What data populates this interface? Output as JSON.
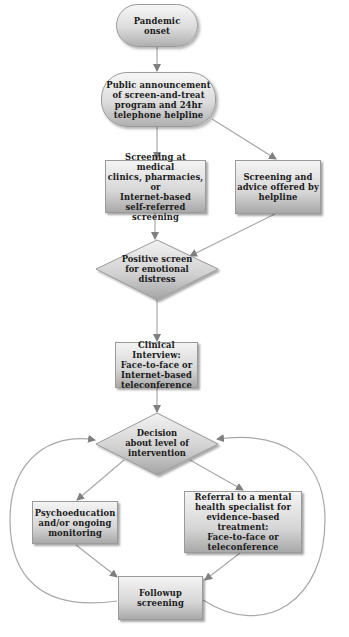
{
  "diagram": {
    "type": "flowchart",
    "colors": {
      "node_fill_top": "#f4f4f4",
      "node_fill_bottom": "#a9a9a9",
      "edge": "#9a9a9a",
      "arrowhead": "#7f7f7f",
      "text": "#1a1a1a"
    },
    "nodes": {
      "pandemic_onset": {
        "shape": "pill",
        "label": "Pandemic\nonset"
      },
      "public_announcement": {
        "shape": "pill",
        "label": "Public announcement\nof screen-and-treat\nprogram and 24hr\ntelephone helpline"
      },
      "screening_medical": {
        "shape": "rect",
        "label": "Screening at medical\nclinics, pharmacies, or\nInternet-based\nself-referred\nscreening"
      },
      "screening_helpline": {
        "shape": "rect",
        "label": "Screening and\nadvice offered by\nhelpline"
      },
      "positive_screen": {
        "shape": "diamond",
        "label": "Positive screen\nfor emotional\ndistress"
      },
      "clinical_interview": {
        "shape": "rect",
        "label": "Clinical Interview:\nFace-to-face or\nInternet-based\nteleconference"
      },
      "decision": {
        "shape": "diamond",
        "label": "Decision\nabout level of\nintervention"
      },
      "psychoeducation": {
        "shape": "rect",
        "label": "Psychoeducation\nand/or ongoing\nmonitoring"
      },
      "referral": {
        "shape": "rect",
        "label": "Referral to a mental\nhealth specialist for\nevidence-based\ntreatment:\nFace-to-face or\nteleconference"
      },
      "followup": {
        "shape": "rect",
        "label": "Followup\nscreening"
      }
    },
    "edges": [
      {
        "from": "pandemic_onset",
        "to": "public_announcement"
      },
      {
        "from": "public_announcement",
        "to": "screening_medical"
      },
      {
        "from": "public_announcement",
        "to": "screening_helpline"
      },
      {
        "from": "screening_medical",
        "to": "positive_screen"
      },
      {
        "from": "screening_helpline",
        "to": "positive_screen"
      },
      {
        "from": "positive_screen",
        "to": "clinical_interview"
      },
      {
        "from": "clinical_interview",
        "to": "decision"
      },
      {
        "from": "decision",
        "to": "psychoeducation"
      },
      {
        "from": "decision",
        "to": "referral"
      },
      {
        "from": "psychoeducation",
        "to": "followup"
      },
      {
        "from": "referral",
        "to": "followup"
      },
      {
        "from": "followup",
        "to": "decision",
        "style": "curved-left-loop"
      },
      {
        "from": "followup",
        "to": "decision",
        "style": "curved-right-loop"
      }
    ]
  }
}
